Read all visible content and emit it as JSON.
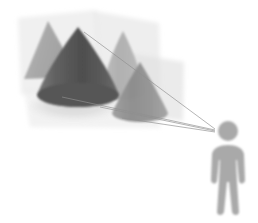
{
  "diagram": {
    "canvas": {
      "width": 258,
      "height": 223,
      "background": "#ffffff"
    },
    "viewer": {
      "label": "Observer / eye point",
      "color": "#a9a9a9",
      "eye_point": {
        "x": 207,
        "y": 130
      },
      "head": {
        "cx": 228,
        "cy": 132,
        "r": 10
      },
      "body": {
        "x": 212,
        "y": 146,
        "width": 32,
        "height": 66
      }
    },
    "projection_rays": {
      "label": "Projection rays",
      "color": "#9a9a9a",
      "count": 4,
      "origin": {
        "x": 214,
        "y": 129
      },
      "targets": [
        {
          "x": 86,
          "y": 33
        },
        {
          "x": 64,
          "y": 96
        },
        {
          "x": 104,
          "y": 104
        },
        {
          "x": 137,
          "y": 108
        }
      ]
    },
    "panels": [
      {
        "name": "image-plane-1",
        "fill": "#e9e9e9",
        "opacity": 0.55,
        "points": "18,18 96,10 100,84 21,95"
      },
      {
        "name": "image-plane-2",
        "fill": "#e4e4e4",
        "opacity": 0.55,
        "points": "96,10 158,22 160,93 100,84"
      },
      {
        "name": "image-plane-3",
        "fill": "#e2e2e2",
        "opacity": 0.6,
        "points": "130,54 183,62 182,120 131,114"
      },
      {
        "name": "ground-plane",
        "fill": "#eeeeee",
        "opacity": 0.7,
        "points": "24,88 152,92 160,128 30,126"
      }
    ],
    "shadow_ellipse": {
      "name": "cone-base-shadow",
      "fill": "#dcdcdc",
      "cx": 74,
      "cy": 106,
      "rx": 44,
      "ry": 14
    },
    "cones": [
      {
        "name": "projected-triangle-far",
        "kind": "triangle",
        "fill": "#a6a6a6",
        "opacity": 0.92,
        "points": "48,22 25,78 78,76"
      },
      {
        "name": "cone-primary",
        "kind": "cone",
        "fill": "#585858",
        "opacity": 1,
        "apex": {
          "x": 78,
          "y": 28
        },
        "base": {
          "cx": 78,
          "cy": 96,
          "rx": 41,
          "ry": 12
        }
      },
      {
        "name": "cone-projection-mid",
        "kind": "cone",
        "fill": "#b2b2b2",
        "opacity": 0.95,
        "apex": {
          "x": 123,
          "y": 31
        },
        "base": {
          "cx": 123,
          "cy": 94,
          "rx": 22,
          "ry": 8
        }
      },
      {
        "name": "cone-projection-near",
        "kind": "cone",
        "fill": "#8f8f8f",
        "opacity": 0.95,
        "apex": {
          "x": 140,
          "y": 63
        },
        "base": {
          "cx": 140,
          "cy": 114,
          "rx": 28,
          "ry": 9
        }
      }
    ],
    "palette": {
      "background": "#ffffff",
      "panel_light": "#e9e9e9",
      "cone_dark": "#585858",
      "cone_mid": "#8f8f8f",
      "cone_light": "#b2b2b2",
      "figure": "#a9a9a9",
      "ray": "#9a9a9a",
      "shadow": "#dcdcdc"
    }
  }
}
